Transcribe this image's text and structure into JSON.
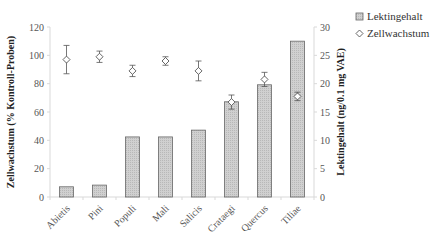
{
  "chart_data": {
    "type": "bar+scatter",
    "title": "",
    "categories": [
      "Abietis",
      "Pini",
      "Populi",
      "Mali",
      "Salicis",
      "Crataegi",
      "Quercus",
      "Tiliae"
    ],
    "series": [
      {
        "name": "Lektingehalt",
        "type": "bar",
        "axis": "right",
        "values": [
          1.8,
          2.1,
          10.6,
          10.6,
          11.8,
          16.8,
          19.8,
          27.5
        ],
        "color": "#c8c8c8"
      },
      {
        "name": "Zellwachstum",
        "type": "scatter",
        "axis": "left",
        "marker": "diamond-open",
        "values": [
          97,
          99,
          89,
          96,
          89,
          67,
          83,
          71
        ],
        "error": [
          10,
          4,
          4,
          3,
          7,
          5,
          5,
          3
        ]
      }
    ],
    "ylabel": "Zellwachstum (% Kontroll-Proben)",
    "ylabel_right": "Lektingehalt (ng/0.1 mg VAE)",
    "xlabel": "",
    "ylim": [
      0,
      120
    ],
    "ylim_right": [
      0,
      30
    ],
    "yticks": [
      0,
      20,
      40,
      60,
      80,
      100,
      120
    ],
    "yticks_right": [
      0,
      5,
      10,
      15,
      20,
      25,
      30
    ],
    "grid": false,
    "legend_position": "top-right"
  },
  "legend": {
    "items": [
      {
        "label": "Lektingehalt",
        "symbol": "gray-square"
      },
      {
        "label": "Zellwachstum",
        "symbol": "open-diamond"
      }
    ]
  }
}
